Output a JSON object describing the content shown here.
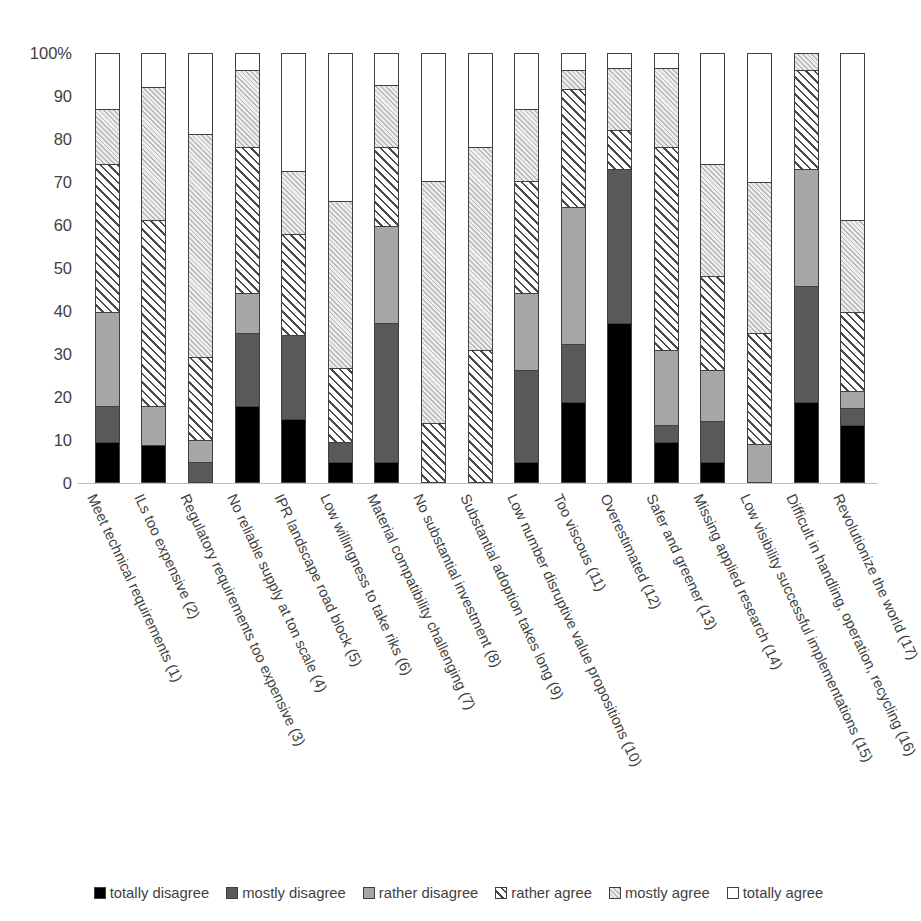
{
  "chart_data": {
    "type": "bar",
    "subtype": "stacked-100-percent",
    "title": "",
    "xlabel": "",
    "ylabel": "",
    "ylim": [
      0,
      100
    ],
    "yticks": [
      "0",
      "10",
      "20",
      "30",
      "40",
      "50",
      "60",
      "70",
      "80",
      "90",
      "100%"
    ],
    "ytick_values": [
      0,
      10,
      20,
      30,
      40,
      50,
      60,
      70,
      80,
      90,
      100
    ],
    "grid": false,
    "legend_position": "bottom",
    "orientation": "vertical",
    "categories": [
      "Meet technical requirements (1)",
      "ILs too expensive (2)",
      "Regulatory requirements too expensive (3)",
      "No reliable supply at ton scale (4)",
      "IPR landscape road block (5)",
      "Low willingness to take riks (6)",
      "Material compatibility challenging (7)",
      "No substantial investment (8)",
      "Substantial adoption takes long (9)",
      "Low number disruptive value propositions (10)",
      "Too viscous (11)",
      "Overestimated (12)",
      "Safer and greener (13)",
      "Missing applied research (14)",
      "Low visibility successful implementations (15)",
      "Difficult in handling, operation, recycling (16)",
      "Revolutionize the world (17)"
    ],
    "series": [
      {
        "name": "totally disagree",
        "color": "#000000",
        "pattern": "solid",
        "values": [
          9,
          8.5,
          0,
          17.5,
          14.5,
          4.5,
          4.5,
          0,
          0,
          4.5,
          18.5,
          37,
          9,
          4.5,
          0,
          18.5,
          13
        ]
      },
      {
        "name": "mostly disagree",
        "color": "#595959",
        "pattern": "solid",
        "values": [
          8.5,
          0,
          4.5,
          17,
          19.5,
          4.5,
          32.5,
          0,
          0,
          21.5,
          13.5,
          36,
          4,
          9.5,
          0,
          27,
          4
        ]
      },
      {
        "name": "rather disagree",
        "color": "#a6a6a6",
        "pattern": "solid",
        "values": [
          22,
          9,
          5,
          9.5,
          0,
          0,
          22.5,
          0,
          0,
          18,
          32,
          0,
          17.5,
          12,
          8.5,
          27.5,
          4
        ]
      },
      {
        "name": "rather agree",
        "color": "#ffffff",
        "pattern": "diagonal-hatch",
        "values": [
          34.5,
          43.5,
          19.5,
          34,
          23.5,
          17.5,
          18.5,
          13.5,
          30.5,
          26,
          27.5,
          9,
          47.5,
          22,
          26,
          23,
          18.5
        ]
      },
      {
        "name": "mostly agree",
        "color": "#f2f2f2",
        "pattern": "fine-hatch",
        "values": [
          13,
          31,
          52,
          18,
          14.5,
          39,
          14.5,
          56.5,
          47.5,
          17,
          4.5,
          14.5,
          18.5,
          26,
          35,
          4,
          21.5
        ]
      },
      {
        "name": "totally agree",
        "color": "#ffffff",
        "pattern": "none",
        "values": [
          13,
          8,
          19,
          4,
          14,
          34.5,
          7.5,
          30,
          22,
          13,
          4,
          3.5,
          3.5,
          26,
          30,
          0,
          39
        ]
      }
    ],
    "legend": [
      "totally disagree",
      "mostly disagree",
      "rather disagree",
      "rather agree",
      "mostly agree",
      "totally agree"
    ]
  }
}
